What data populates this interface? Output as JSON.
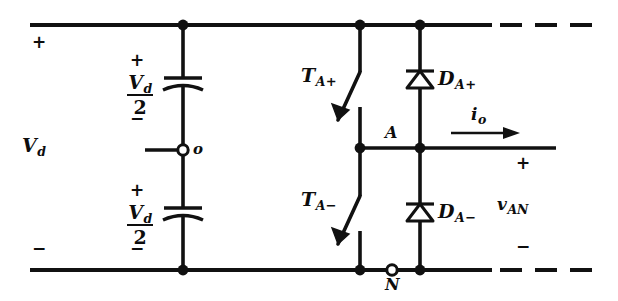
{
  "figure": {
    "stroke_color": "#111111",
    "background_color": "#ffffff"
  },
  "labels": {
    "dc_bus_plus": "+",
    "dc_bus_minus": "−",
    "vd_source": "V",
    "vd_source_sub": "d",
    "cap_top_plus": "+",
    "cap_top_minus": "−",
    "cap_bot_plus": "+",
    "cap_bot_minus": "−",
    "cap_numerator": "V",
    "cap_numerator_sub": "d",
    "cap_denominator": "2",
    "midpoint_terminal": "o",
    "switch_upper": "T",
    "switch_upper_sub": "A",
    "switch_upper_sign": "+",
    "switch_lower": "T",
    "switch_lower_sub": "A",
    "switch_lower_sign": "−",
    "diode_upper": "D",
    "diode_upper_sub": "A",
    "diode_upper_sign": "+",
    "diode_lower": "D",
    "diode_lower_sub": "A",
    "diode_lower_sign": "−",
    "pole_node": "A",
    "neutral_terminal": "N",
    "output_current": "i",
    "output_current_sub": "o",
    "output_voltage": "v",
    "output_voltage_sub": "AN",
    "output_plus": "+",
    "output_minus": "−"
  },
  "icons": {
    "capacitor": "capacitor-icon",
    "diode": "diode-icon",
    "switch": "switch-icon",
    "solid_node": "junction-dot-icon",
    "open_terminal": "open-terminal-icon",
    "current_arrow": "current-arrow-icon",
    "dashed_rail": "dashed-rail-icon"
  },
  "geometry": {
    "top_rail_y": 25,
    "mid_rail_y": 148,
    "bottom_rail_y": 270,
    "cap_branch_x": 183,
    "switch_branch_x": 360,
    "diode_branch_x": 420,
    "midpoint_circle_x": 183,
    "midpoint_circle_y": 150,
    "neutral_circle_x": 392,
    "neutral_circle_y": 270
  }
}
